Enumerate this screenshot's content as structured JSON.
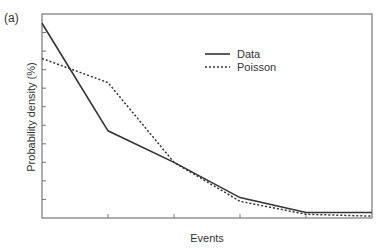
{
  "panel_label": "(a)",
  "chart_data": {
    "type": "line",
    "title": "",
    "xlabel": "Events",
    "ylabel": "Probability density (%)",
    "x": [
      0,
      1,
      2,
      3,
      4,
      5
    ],
    "xlim": [
      0,
      5
    ],
    "ylim": [
      0,
      11
    ],
    "x_ticks": [
      1,
      2,
      3,
      4
    ],
    "y_ticks": [
      1,
      2,
      3,
      4,
      5,
      6,
      7,
      8,
      9,
      10
    ],
    "tick_labels_shown": false,
    "grid": false,
    "legend_position": "top-right",
    "series": [
      {
        "name": "Data",
        "style": "solid",
        "color": "#333333",
        "values": [
          10.5,
          4.7,
          3.0,
          1.1,
          0.3,
          0.3
        ]
      },
      {
        "name": "Poisson",
        "style": "dotted",
        "color": "#333333",
        "values": [
          8.6,
          7.3,
          3.0,
          0.9,
          0.2,
          0.1
        ]
      }
    ]
  }
}
